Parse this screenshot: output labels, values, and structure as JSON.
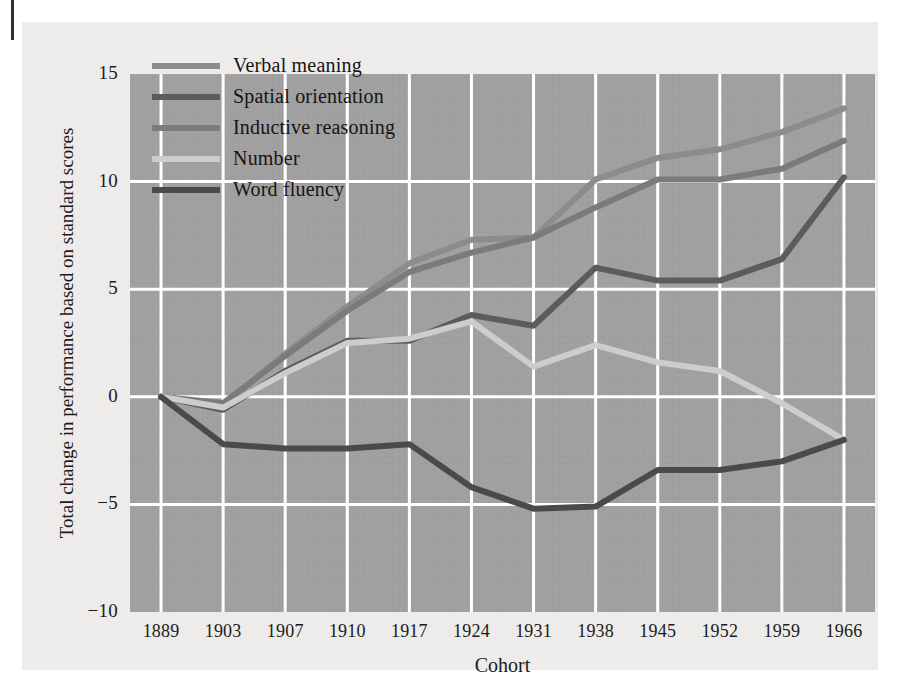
{
  "figure": {
    "background_color": "#edecea",
    "plot_background_color": "#a0a0a0",
    "grid_color": "#ffffff"
  },
  "axes": {
    "ylabel": "Total change in performance based on standard scores",
    "xlabel": "Cohort",
    "yticks": [
      "15",
      "10",
      "5",
      "0",
      "−5",
      "−10"
    ],
    "xticks": [
      "1889",
      "1903",
      "1907",
      "1910",
      "1917",
      "1924",
      "1931",
      "1938",
      "1945",
      "1952",
      "1959",
      "1966"
    ]
  },
  "legend": {
    "position": "upper-left-inside",
    "entries": [
      {
        "label": "Verbal meaning",
        "color": "#8c8c8c"
      },
      {
        "label": "Spatial orientation",
        "color": "#5c5c5c"
      },
      {
        "label": "Inductive reasoning",
        "color": "#7b7b7b"
      },
      {
        "label": "Number",
        "color": "#cdcdcd"
      },
      {
        "label": "Word fluency",
        "color": "#4a4a4a"
      }
    ]
  },
  "chart_data": {
    "type": "line",
    "title": "",
    "xlabel": "Cohort",
    "ylabel": "Total change in performance based on standard scores",
    "categories": [
      "1889",
      "1903",
      "1907",
      "1910",
      "1917",
      "1924",
      "1931",
      "1938",
      "1945",
      "1952",
      "1959",
      "1966"
    ],
    "x": [
      1889,
      1903,
      1907,
      1910,
      1917,
      1924,
      1931,
      1938,
      1945,
      1952,
      1959,
      1966
    ],
    "ylim": [
      -10,
      15
    ],
    "yticks": [
      15,
      10,
      5,
      0,
      -5,
      -10
    ],
    "grid": true,
    "legend_position": "upper left",
    "series": [
      {
        "name": "Verbal meaning",
        "color": "#8c8c8c",
        "values": [
          0.0,
          -0.4,
          2.0,
          4.2,
          6.2,
          7.3,
          7.4,
          10.1,
          11.1,
          11.5,
          12.3,
          13.4
        ]
      },
      {
        "name": "Spatial orientation",
        "color": "#5c5c5c",
        "values": [
          0.0,
          -0.6,
          1.2,
          2.6,
          2.6,
          3.8,
          3.3,
          6.0,
          5.4,
          5.4,
          6.4,
          10.2
        ]
      },
      {
        "name": "Inductive reasoning",
        "color": "#7b7b7b",
        "values": [
          0.0,
          -0.3,
          1.9,
          4.0,
          5.8,
          6.7,
          7.4,
          8.8,
          10.1,
          10.1,
          10.6,
          11.9
        ]
      },
      {
        "name": "Number",
        "color": "#cdcdcd",
        "values": [
          0.0,
          -0.5,
          1.1,
          2.5,
          2.7,
          3.5,
          1.4,
          2.4,
          1.6,
          1.2,
          -0.3,
          -2.0
        ]
      },
      {
        "name": "Word fluency",
        "color": "#4a4a4a",
        "values": [
          0.0,
          -2.2,
          -2.4,
          -2.4,
          -2.2,
          -4.2,
          -5.2,
          -5.1,
          -3.4,
          -3.4,
          -3.0,
          -2.0
        ]
      }
    ]
  }
}
